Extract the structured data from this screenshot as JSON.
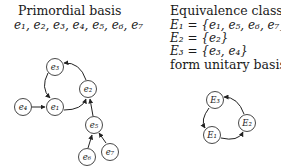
{
  "left_panel": {
    "title": "Primordial basis",
    "basis_list": "e₁, e₂, e₃, e₄, e₅, e₆, e₇",
    "graph": {
      "nodes": [
        {
          "id": "e1",
          "label": "e₁"
        },
        {
          "id": "e2",
          "label": "e₂"
        },
        {
          "id": "e3",
          "label": "e₃"
        },
        {
          "id": "e4",
          "label": "e₄"
        },
        {
          "id": "e5",
          "label": "e₅"
        },
        {
          "id": "e6",
          "label": "e₆"
        },
        {
          "id": "e7",
          "label": "e₇"
        }
      ],
      "edges": [
        {
          "from": "e4",
          "to": "e1"
        },
        {
          "from": "e1",
          "to": "e2"
        },
        {
          "from": "e2",
          "to": "e3"
        },
        {
          "from": "e3",
          "to": "e1"
        },
        {
          "from": "e5",
          "to": "e2"
        },
        {
          "from": "e6",
          "to": "e5"
        },
        {
          "from": "e7",
          "to": "e5"
        }
      ]
    }
  },
  "right_panel": {
    "title": "Equivalence classes",
    "classes": [
      "E₁ = {e₁, e₅, e₆, e₇}",
      "E₂ = {e₂}",
      "E₃ = {e₃, e₄}"
    ],
    "subtitle": "form unitary basis",
    "graph": {
      "nodes": [
        {
          "id": "E1",
          "label": "E₁"
        },
        {
          "id": "E2",
          "label": "E₂"
        },
        {
          "id": "E3",
          "label": "E₃"
        }
      ],
      "edges": [
        {
          "from": "E1",
          "to": "E2"
        },
        {
          "from": "E2",
          "to": "E3"
        },
        {
          "from": "E3",
          "to": "E1"
        }
      ]
    }
  }
}
